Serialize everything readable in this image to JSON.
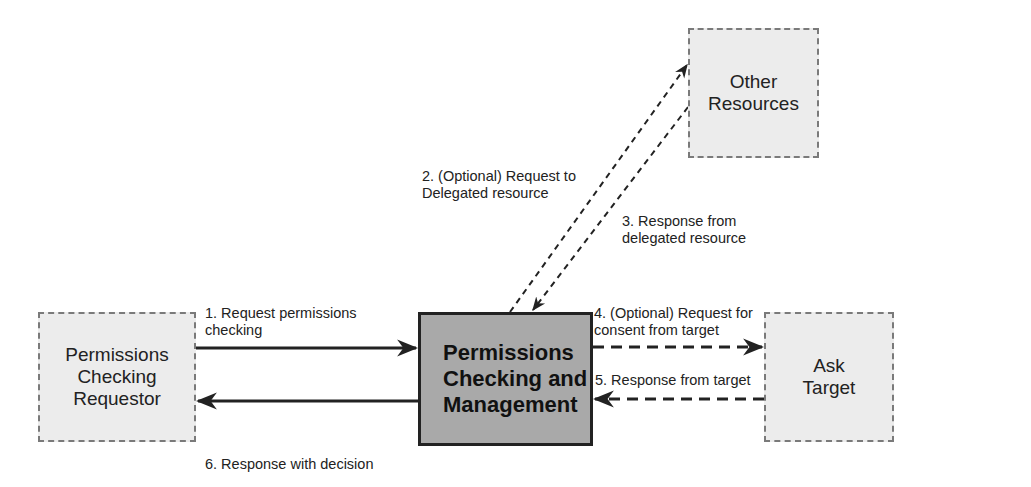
{
  "diagram": {
    "nodes": {
      "requestor": {
        "label": "Permissions\nChecking\nRequestor",
        "style": "dashed"
      },
      "main": {
        "label": "Permissions\nChecking and\nManagement",
        "style": "solid-bold"
      },
      "target": {
        "label": "Ask\nTarget",
        "style": "dashed"
      },
      "resources": {
        "label": "Other\nResources",
        "style": "dashed"
      }
    },
    "edges": [
      {
        "id": 1,
        "from": "requestor",
        "to": "main",
        "label": "1. Request permissions\nchecking",
        "line": "solid"
      },
      {
        "id": 2,
        "from": "main",
        "to": "resources",
        "label": "2. (Optional) Request to\nDelegated resource",
        "line": "dashed"
      },
      {
        "id": 3,
        "from": "resources",
        "to": "main",
        "label": "3. Response from\ndelegated resource",
        "line": "dashed"
      },
      {
        "id": 4,
        "from": "main",
        "to": "target",
        "label": "4. (Optional) Request for\nconsent from target",
        "line": "dashed"
      },
      {
        "id": 5,
        "from": "target",
        "to": "main",
        "label": "5. Response from target",
        "line": "dashed"
      },
      {
        "id": 6,
        "from": "main",
        "to": "requestor",
        "label": "6. Response with decision",
        "line": "solid"
      }
    ]
  },
  "colors": {
    "dashed_fill": "#ececec",
    "main_fill": "#a9a9a9",
    "line": "#222222"
  }
}
